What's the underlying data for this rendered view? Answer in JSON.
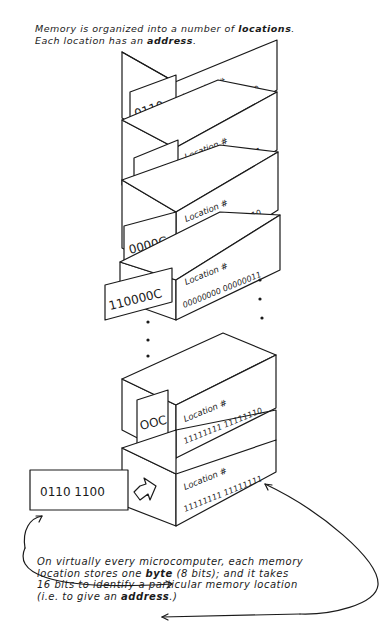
{
  "diagram": {
    "title_caption": {
      "line1_prefix": "Memory is organized into a number of ",
      "line1_bold": "locations",
      "line1_suffix": ".",
      "line2_prefix": "Each location has an ",
      "line2_bold": "address",
      "line2_suffix": "."
    },
    "location_label": "Location #",
    "blocks": [
      {
        "contents": "0110",
        "address": "00000000 00000000"
      },
      {
        "contents": "1111",
        "address": "00000000 00000001"
      },
      {
        "contents": "0000C",
        "address": "00000000 00000010"
      },
      {
        "contents": "110000C",
        "address": "00000000 00000011"
      },
      {
        "contents": "OOC",
        "address": "11111111 11111110"
      },
      {
        "contents": "",
        "address": "11111111 11111111"
      }
    ],
    "ellipsis": "•",
    "byte_card": {
      "value": "0110 1100"
    },
    "bottom_caption": {
      "line1": "On virtually every microcomputer, each memory",
      "line2_prefix": "location stores one ",
      "line2_bold": "byte",
      "line2_suffix": " (8 bits); and it takes",
      "line3": "16 bits to identify a particular memory location",
      "line4_prefix": "(i.e. to give an ",
      "line4_bold": "address",
      "line4_suffix": ".)"
    }
  }
}
